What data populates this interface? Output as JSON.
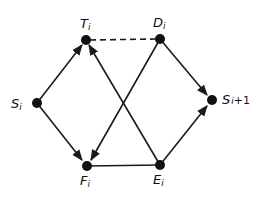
{
  "diagram": {
    "type": "directed-graph",
    "nodes": [
      {
        "id": "S_i",
        "base": "S",
        "sub": "i",
        "x": 37,
        "y": 103
      },
      {
        "id": "T_i",
        "base": "T",
        "sub": "i",
        "x": 86,
        "y": 40
      },
      {
        "id": "D_i",
        "base": "D",
        "sub": "i",
        "x": 160,
        "y": 39
      },
      {
        "id": "F_i",
        "base": "F",
        "sub": "i",
        "x": 87,
        "y": 166
      },
      {
        "id": "E_i",
        "base": "E",
        "sub": "i",
        "x": 160,
        "y": 165
      },
      {
        "id": "S_i+1",
        "base": "S",
        "sub": "i+1",
        "x": 212,
        "y": 100
      }
    ],
    "edges": [
      {
        "from": "S_i",
        "to": "T_i",
        "style": "solid",
        "directed": true
      },
      {
        "from": "S_i",
        "to": "F_i",
        "style": "solid",
        "directed": true
      },
      {
        "from": "T_i",
        "to": "D_i",
        "style": "dashed",
        "directed": false
      },
      {
        "from": "D_i",
        "to": "S_i+1",
        "style": "solid",
        "directed": true
      },
      {
        "from": "D_i",
        "to": "F_i",
        "style": "solid",
        "directed": true
      },
      {
        "from": "E_i",
        "to": "T_i",
        "style": "solid",
        "directed": true
      },
      {
        "from": "F_i",
        "to": "E_i",
        "style": "solid",
        "directed": false
      },
      {
        "from": "E_i",
        "to": "S_i+1",
        "style": "solid",
        "directed": true
      }
    ]
  },
  "labels": {
    "S_i": {
      "base": "S",
      "sub": "i"
    },
    "T_i": {
      "base": "T",
      "sub": "i"
    },
    "D_i": {
      "base": "D",
      "sub": "i"
    },
    "F_i": {
      "base": "F",
      "sub": "i"
    },
    "E_i": {
      "base": "E",
      "sub": "i"
    },
    "S_i1": {
      "base": "S",
      "sub": "i",
      "suffix": "+1"
    }
  }
}
